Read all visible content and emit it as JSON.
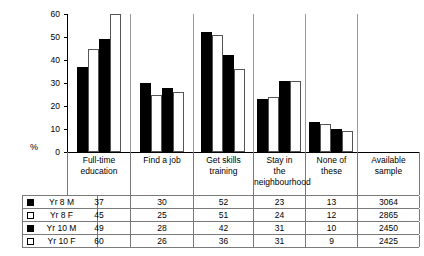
{
  "chart_data": {
    "type": "bar",
    "title": "",
    "xlabel": "",
    "ylabel": "%",
    "ylim": [
      0,
      60
    ],
    "yticks": [
      0,
      10,
      20,
      30,
      40,
      50,
      60
    ],
    "grid": false,
    "legend_position": "table-left",
    "categories": [
      "Full-time education",
      "Find a job",
      "Get skills training",
      "Stay in the neighbourhood",
      "None of these"
    ],
    "series": [
      {
        "name": "Yr 8 M",
        "swatch": "filled",
        "values": [
          37,
          30,
          52,
          23,
          13
        ],
        "available_sample": 3064
      },
      {
        "name": "Yr 8 F",
        "swatch": "hollow",
        "values": [
          45,
          25,
          51,
          24,
          12
        ],
        "available_sample": 2865
      },
      {
        "name": "Yr 10 M",
        "swatch": "filled",
        "values": [
          49,
          28,
          42,
          31,
          10
        ],
        "available_sample": 2450
      },
      {
        "name": "Yr 10 F",
        "swatch": "hollow",
        "values": [
          60,
          26,
          36,
          31,
          9
        ],
        "available_sample": 2425
      }
    ]
  },
  "table": {
    "headers": [
      "Full-time education",
      "Find a job",
      "Get skills training",
      "Stay in the neighbourhood",
      "None of these",
      "Available sample"
    ],
    "header_lines": [
      [
        "Full-time",
        "education"
      ],
      [
        "Find a job"
      ],
      [
        "Get skills",
        "training"
      ],
      [
        "Stay in",
        "the",
        "neighbourhood"
      ],
      [
        "None of these"
      ],
      [
        "Available",
        "sample"
      ]
    ],
    "rows": [
      {
        "label": "Yr 8 M",
        "swatch": "filled",
        "cells": [
          "37",
          "30",
          "52",
          "23",
          "13",
          "3064"
        ]
      },
      {
        "label": "Yr 8 F",
        "swatch": "hollow",
        "cells": [
          "45",
          "25",
          "51",
          "24",
          "12",
          "2865"
        ]
      },
      {
        "label": "Yr 10 M",
        "swatch": "filled",
        "cells": [
          "49",
          "28",
          "42",
          "31",
          "10",
          "2450"
        ]
      },
      {
        "label": "Yr 10 F",
        "swatch": "hollow",
        "cells": [
          "60",
          "26",
          "36",
          "31",
          "9",
          "2425"
        ]
      }
    ]
  },
  "colors": {
    "bar_filled": "#000000",
    "bar_hollow_fill": "#ffffff",
    "bar_hollow_stroke": "#555555",
    "axis": "#000000",
    "table_border": "#7a7a7a",
    "text": "#000000"
  }
}
